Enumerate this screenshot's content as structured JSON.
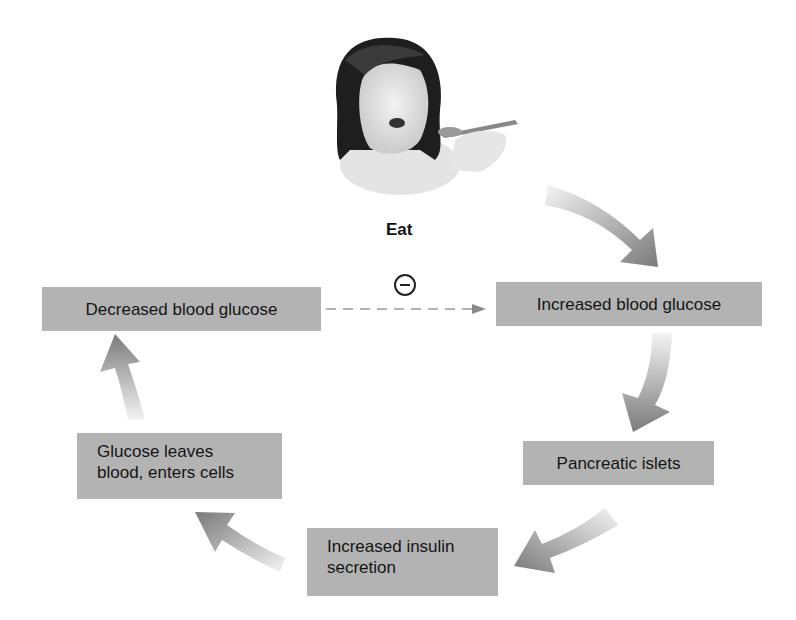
{
  "stimulus": {
    "label": "Eat",
    "icon": "girl-eating-with-spoon"
  },
  "inhibition_symbol": "minus-circle",
  "boxes": {
    "increased_glucose": "Increased blood glucose",
    "pancreatic_islets": "Pancreatic islets",
    "insulin_line1": "Increased insulin",
    "insulin_line2": "secretion",
    "glucose_leaves_line1": "Glucose leaves",
    "glucose_leaves_line2": "blood, enters cells",
    "decreased_glucose": "Decreased blood glucose"
  },
  "flow": [
    "Eat",
    "Increased blood glucose",
    "Pancreatic islets",
    "Increased insulin secretion",
    "Glucose leaves blood, enters cells",
    "Decreased blood glucose",
    "(negative feedback) Increased blood glucose"
  ],
  "colors": {
    "box_fill": "#b3b3b3",
    "arrow_dark": "#7a7a7a",
    "arrow_light": "#f2f2f2",
    "dashed_line": "#9a9a9a"
  }
}
